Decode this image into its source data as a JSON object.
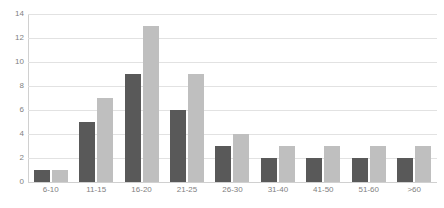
{
  "chart_data": {
    "type": "bar",
    "title": "",
    "subtitle": "",
    "xlabel": "",
    "ylabel": "",
    "categories": [
      "6-10",
      "11-15",
      "16-20",
      "21-25",
      "26-30",
      "31-40",
      "41-50",
      "51-60",
      ">60"
    ],
    "series": [
      {
        "name": "Series 1",
        "color": "#595959",
        "values": [
          1,
          5,
          9,
          6,
          3,
          2,
          2,
          2,
          2
        ]
      },
      {
        "name": "Series 2",
        "color": "#bfbfbf",
        "values": [
          1,
          7,
          13,
          9,
          4,
          3,
          3,
          3,
          3
        ]
      }
    ],
    "ylim": [
      0,
      14
    ],
    "ytick_labels": [
      "14",
      "12",
      "10",
      "8",
      "6",
      "4",
      "2",
      "0"
    ],
    "ytick_values": [
      14,
      12,
      10,
      8,
      6,
      4,
      2,
      0
    ],
    "ytick_step": 2,
    "grid": "horizontal",
    "legend": "none",
    "gridline_color": "#e2e2e2",
    "axis_color": "#d0d0d0",
    "tick_label_color": "#7f7f7f",
    "background_color": "#ffffff"
  }
}
